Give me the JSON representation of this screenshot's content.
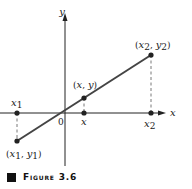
{
  "figure": {
    "caption_label": "Figure 3.6",
    "axes": {
      "x_label": "x",
      "y_label": "y",
      "origin_label": "0"
    },
    "points": [
      {
        "id": "p1",
        "label": "(x1, y1)",
        "axis_label": "x1",
        "px": [
          17,
          141
        ],
        "axis_px": [
          17,
          113
        ]
      },
      {
        "id": "p",
        "label": "(x, y)",
        "axis_label": "x",
        "px": [
          84,
          98
        ],
        "axis_px": [
          84,
          113
        ]
      },
      {
        "id": "p2",
        "label": "(x2, y2)",
        "axis_label": "x2",
        "px": [
          151,
          55
        ],
        "axis_px": [
          151,
          113
        ]
      }
    ],
    "colors": {
      "line": "#444444",
      "axis": "#222222",
      "dash": "#555555",
      "point": "#222222"
    }
  }
}
